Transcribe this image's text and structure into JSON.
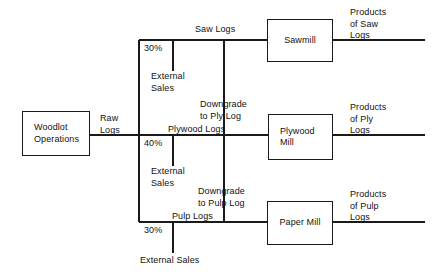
{
  "diagram": {
    "type": "process-flow",
    "stroke_color": "#1a1a1a",
    "background_color": "#ffffff",
    "source": {
      "label": "Woodlot\nOperations",
      "output_label": "Raw\nLogs"
    },
    "branches": [
      {
        "id": "saw",
        "percent": "30%",
        "stream_label": "Saw Logs",
        "external_label": "External\nSales",
        "mill_label": "Sawmill",
        "product_label": "Products\nof Saw\nLogs",
        "downgrade_label": "Downgrade\nto Ply Log"
      },
      {
        "id": "ply",
        "percent": "40%",
        "stream_label": "Plywood Logs",
        "external_label": "External\nSales",
        "mill_label": "Plywood\nMill",
        "product_label": "Products\nof Ply\nLogs",
        "downgrade_label": "Downgrade\nto Pulp Log"
      },
      {
        "id": "pulp",
        "percent": "30%",
        "stream_label": "Pulp Logs",
        "external_label": "External Sales",
        "mill_label": "Paper Mill",
        "product_label": "Products\nof Pulp\nLogs",
        "downgrade_label": ""
      }
    ]
  }
}
